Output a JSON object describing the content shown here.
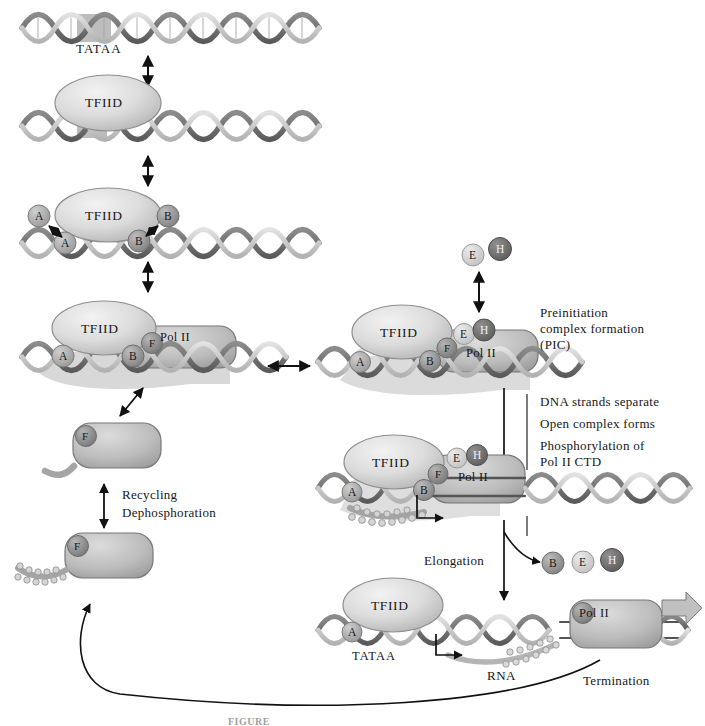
{
  "figure": {
    "caption_partial": "FIGURE",
    "background": "#ffffff"
  },
  "palette": {
    "dna_dark": "#6f6f6f",
    "dna_light": "#c9c9c9",
    "dna_outline": "#3a3a3a",
    "tfiid_fill": "#d8d8d8",
    "tfiid_edge": "#707070",
    "polii_fill": "#b9b9b9",
    "polii_edge": "#6a6a6a",
    "sphere_a": "#a8a8a8",
    "sphere_b": "#909090",
    "sphere_f": "#8a8a8a",
    "sphere_e": "#d0d0d0",
    "sphere_h": "#6e6e6e",
    "tata_box": "#bdbdbd",
    "arrow": "#111111",
    "rna": "#b0b0b0",
    "phosphate": "#cfcfcf",
    "text": "#171717"
  },
  "labels": {
    "tataa_top": "TATAA",
    "tataa_bottom": "TATAA",
    "tfiid": "TFIID",
    "polii": "Pol II",
    "factor_a": "A",
    "factor_b": "B",
    "factor_e": "E",
    "factor_f": "F",
    "factor_h": "H",
    "rna": "RNA",
    "pic_line1": "Preinitiation",
    "pic_line2": "complex formation",
    "pic_line3": "(PIC)",
    "step_line1": "DNA strands separate",
    "step_line2": "Open complex forms",
    "step_line3": "Phosphorylation of",
    "step_line4": "Pol II CTD",
    "elongation": "Elongation",
    "termination": "Termination",
    "recycling": "Recycling",
    "dephosphoration": "Dephosphoration"
  },
  "stages": [
    {
      "id": "stage-1",
      "name": "naked-promoter-dna",
      "description": "Free duplex DNA with TATAA box"
    },
    {
      "id": "stage-2",
      "name": "tfiid-bound",
      "description": "TFIID binds the TATAA box"
    },
    {
      "id": "stage-3",
      "name": "tfiia-tfiib-bound",
      "description": "TFIIA and TFIIB associate with TFIID-DNA"
    },
    {
      "id": "stage-4",
      "name": "polii-tfiif-recruited",
      "description": "Pol II with TFIIF joins the complex"
    },
    {
      "id": "stage-5",
      "name": "preinitiation-complex",
      "description": "TFIIE and TFIIH complete the PIC"
    },
    {
      "id": "stage-6",
      "name": "open-complex",
      "description": "DNA melted, Pol II CTD phosphorylated"
    },
    {
      "id": "stage-7",
      "name": "elongation-complex",
      "description": "Pol II elongating, RNA emerging"
    },
    {
      "id": "stage-8",
      "name": "phosphorylated-polii-released",
      "description": "Phosphorylated Pol II with TFIIF released"
    },
    {
      "id": "stage-9",
      "name": "dephosphorylated-polii",
      "description": "Dephosphorylated Pol II ready for reuse"
    }
  ]
}
